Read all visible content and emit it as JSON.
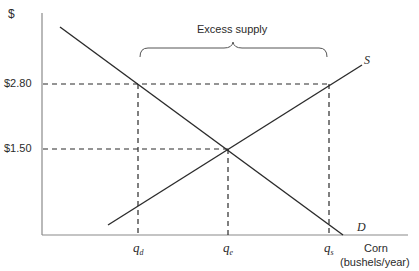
{
  "diagram": {
    "type": "supply-demand",
    "y_axis_label": "$",
    "x_axis_label_line1": "Corn",
    "x_axis_label_line2": "(bushels/year)",
    "price_labels": {
      "high": "$2.80",
      "equilibrium": "$1.50"
    },
    "quantity_labels": {
      "qd": {
        "base": "q",
        "sub": "d"
      },
      "qe": {
        "base": "q",
        "sub": "e"
      },
      "qs": {
        "base": "q",
        "sub": "s"
      }
    },
    "curve_labels": {
      "supply": "S",
      "demand": "D"
    },
    "annotation": "Excess supply",
    "colors": {
      "lines": "#2b2b2b",
      "axis": "#8a8a8a",
      "background": "#ffffff"
    }
  }
}
